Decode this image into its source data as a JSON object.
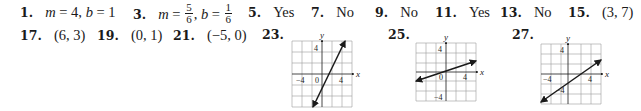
{
  "answers_row1": [
    {
      "number": "1.",
      "text": "m = 4, b = 1",
      "parts": {
        "m_var": "m",
        "m_eq": " = 4, ",
        "b_var": "b",
        "b_eq": " = 1"
      }
    },
    {
      "number": "3.",
      "parts": {
        "m_var": "m",
        "m_eq": " = ",
        "m_num": "5",
        "m_den": "6",
        "comma": ", ",
        "b_var": "b",
        "b_eq": " = ",
        "b_num": "1",
        "b_den": "6"
      }
    },
    {
      "number": "5.",
      "text": "Yes"
    },
    {
      "number": "7.",
      "text": "No"
    },
    {
      "number": "9.",
      "text": "No"
    },
    {
      "number": "11.",
      "text": "Yes"
    },
    {
      "number": "13.",
      "text": "No"
    },
    {
      "number": "15.",
      "text": "(3, 7)"
    }
  ],
  "answers_row2": [
    {
      "number": "17.",
      "text": "(6, 3)"
    },
    {
      "number": "19.",
      "text": "(0, 1)"
    },
    {
      "number": "21.",
      "text": "(−5, 0)"
    },
    {
      "number": "23."
    },
    {
      "number": "25."
    },
    {
      "number": "27."
    }
  ],
  "graphs": [
    {
      "number": "23.",
      "x_label": "x",
      "y_label": "y",
      "tick_neg4": "−4",
      "tick_0": "0",
      "tick_pos4_x": "4",
      "tick_pos4_y": "4",
      "line": {
        "slope": 3,
        "intercept": -3
      }
    },
    {
      "number": "25.",
      "x_label": "x",
      "y_label": "y",
      "tick_0": "0",
      "tick_pos4_x": "4",
      "tick_pos4_y": "4",
      "tick_neg4_y": "−4",
      "line": {
        "slope": 0.333,
        "intercept": 0
      }
    },
    {
      "number": "27.",
      "x_label": "x",
      "y_label": "y",
      "tick_neg4_x": "−4",
      "tick_pos4_x": "4",
      "tick_pos4_y": "4",
      "tick_neg4_y": "−4",
      "line": {
        "slope": 0.667,
        "intercept": -1.333
      }
    }
  ]
}
